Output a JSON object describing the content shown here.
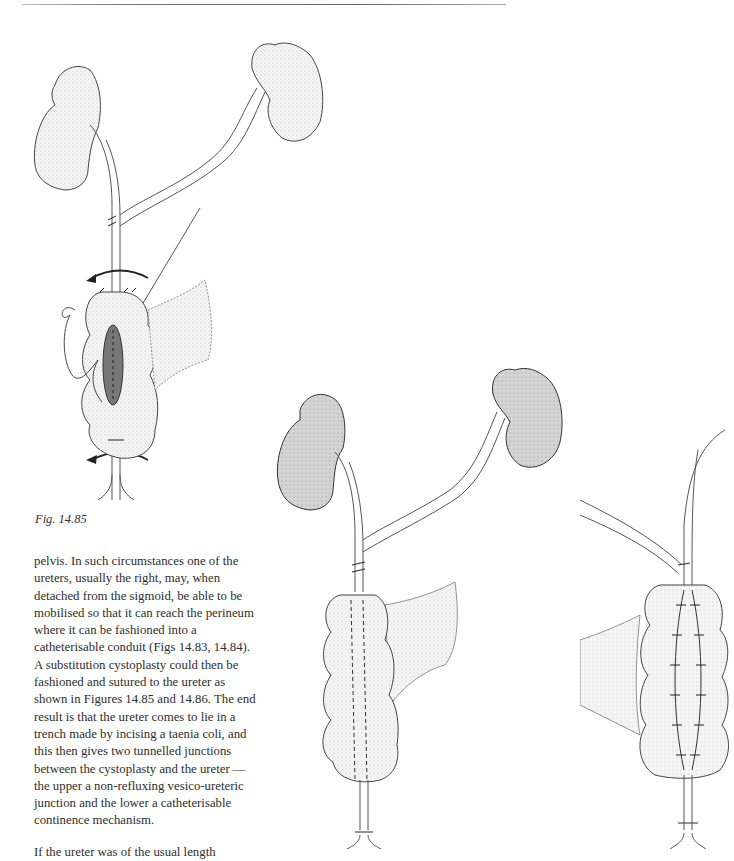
{
  "page": {
    "header_rule": true
  },
  "figures": [
    {
      "id": "fig-14-85",
      "caption": "Fig. 14.85",
      "description": "Two kidneys with ureters joined; ureter laid in incised taenia coli trench on bowel segment with suture and rotation arrows"
    },
    {
      "id": "fig-14-86-a",
      "description": "Two shaded kidneys with ureters joined above a cystoplasty; dashed lines show tunnelled ureter"
    },
    {
      "id": "fig-14-86-b",
      "description": "Cystoplasty with sutured taenia coli over tunnelled ureter, close-up view"
    }
  ],
  "text": {
    "paragraph1": "pelvis. In such circumstances one of the ureters, usually the right, may, when detached from the sigmoid, be able to be mobilised so that it can reach the perineum where it can be fashioned into a catheterisable conduit (Figs 14.83, 14.84). A substitution cystoplasty could then be fashioned and sutured to the ureter as shown in Figures 14.85 and 14.86. The end result is that the ureter comes to lie in a trench made by incising a taenia coli, and this then gives two tunnelled junctions between the cystoplasty and the ureter — the upper a non-refluxing vesico-ureteric junction and the lower a catheterisable continence mechanism.",
    "paragraph2_partial": "If the ureter was of the usual length"
  }
}
